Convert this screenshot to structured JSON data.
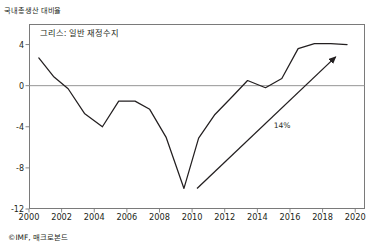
{
  "header": {
    "unit_label": "국내총생산 대비율"
  },
  "footer": {
    "source": "©IMF, 매크로본드"
  },
  "chart_data": {
    "type": "line",
    "title": "그리스: 일반 재정수지",
    "xlabel": "",
    "ylabel": "국내총생산 대비율",
    "xlim": [
      2000,
      2020.6
    ],
    "ylim": [
      -12,
      6
    ],
    "grid": false,
    "legend": "none",
    "zero_line": 0,
    "line_color": "#231f20",
    "axis_color": "#7a7a7a",
    "xticks": [
      2000,
      2002,
      2004,
      2006,
      2008,
      2010,
      2012,
      2014,
      2016,
      2018,
      2020
    ],
    "xtick_labels": [
      "2000",
      "2002",
      "2004",
      "2006",
      "2008",
      "2010",
      "2012",
      "2014",
      "2016",
      "2018",
      "2020"
    ],
    "yticks": [
      4,
      0,
      -4,
      -8,
      -12
    ],
    "ytick_labels": [
      "4",
      "0",
      "-4",
      "-8",
      "-12"
    ],
    "series": [
      {
        "name": "그리스: 일반 재정수지",
        "x": [
          2000.6,
          2001.5,
          2002.4,
          2003.4,
          2004.5,
          2005.5,
          2006.5,
          2007.4,
          2008.4,
          2009.5,
          2010.4,
          2011.4,
          2012.5,
          2013.4,
          2014.5,
          2015.5,
          2016.5,
          2017.5,
          2018.5,
          2019.5
        ],
        "values": [
          2.7,
          0.9,
          -0.3,
          -2.7,
          -4.0,
          -1.5,
          -1.5,
          -2.3,
          -5.0,
          -10.0,
          -5.1,
          -2.8,
          -1.0,
          0.5,
          -0.2,
          0.7,
          3.6,
          4.1,
          4.1,
          4.0
        ]
      }
    ],
    "annotations": [
      {
        "type": "arrow",
        "label": "14%",
        "x_start": 2010.3,
        "y_start": -10.0,
        "x_end": 2018.8,
        "y_end": 2.8,
        "label_x": 2015.0,
        "label_y": -3.9
      }
    ]
  }
}
